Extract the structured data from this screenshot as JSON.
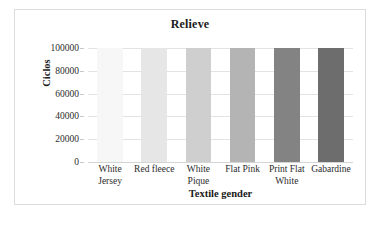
{
  "chart_data": {
    "type": "bar",
    "title": "Relieve",
    "xlabel": "Textile gender",
    "ylabel": "Ciclos",
    "categories": [
      "White Jersey",
      "Red fleece",
      "White Pique",
      "Flat Pink",
      "Print Flat White",
      "Gabardine"
    ],
    "values": [
      100000,
      100000,
      100000,
      100000,
      100000,
      100000
    ],
    "ylim": [
      0,
      100000
    ],
    "yticks": [
      0,
      20000,
      40000,
      60000,
      80000,
      100000
    ],
    "ytick_labels": [
      "0",
      "20000",
      "40000",
      "60000",
      "80000",
      "100000"
    ],
    "grid": true,
    "legend": false,
    "bar_colors": [
      "#f7f7f7",
      "#e6e6e6",
      "#cfcfcf",
      "#b4b4b4",
      "#838383",
      "#6d6d6d"
    ],
    "frame_border_color": "#dcdcdc",
    "gridline_color": "#e3e3e3",
    "text_color": "#1a1a1a"
  }
}
